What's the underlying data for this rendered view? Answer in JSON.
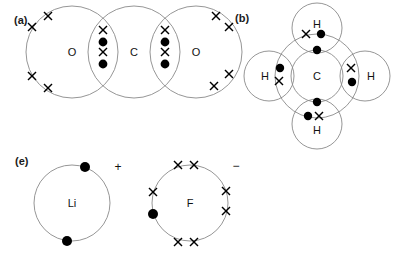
{
  "figure": {
    "background_color": "#ffffff",
    "shell_color": "#8a8a8a",
    "electron_color": "#000000",
    "width": 397,
    "height": 259
  },
  "panels": [
    {
      "key": "a",
      "label": "(a)",
      "molecule": "CO2",
      "description": "carbon dioxide, two carbon-oxygen double bonds",
      "atoms": [
        {
          "symbol": "O",
          "position": "left"
        },
        {
          "symbol": "C",
          "position": "centre"
        },
        {
          "symbol": "O",
          "position": "right"
        }
      ],
      "bonds": [
        {
          "between": "O-C",
          "type": "double",
          "shared_electrons": 4,
          "marks": "X dot X dot"
        },
        {
          "between": "C-O",
          "type": "double",
          "shared_electrons": 4,
          "marks": "X dot X dot"
        }
      ],
      "lone_pairs": {
        "left_oxygen_crosses": 4,
        "right_oxygen_crosses": 4
      }
    },
    {
      "key": "b",
      "label": "(b)",
      "molecule": "CH4",
      "description": "methane, four carbon-hydrogen single bonds",
      "atoms": [
        {
          "symbol": "C",
          "position": "centre"
        },
        {
          "symbol": "H",
          "position": "top"
        },
        {
          "symbol": "H",
          "position": "left"
        },
        {
          "symbol": "H",
          "position": "right"
        },
        {
          "symbol": "H",
          "position": "bottom"
        }
      ],
      "bonds": [
        {
          "between": "C-H",
          "type": "single",
          "shared_electrons": 2,
          "marks": "X dot"
        },
        {
          "between": "C-H",
          "type": "single",
          "shared_electrons": 2,
          "marks": "dot X"
        },
        {
          "between": "C-H",
          "type": "single",
          "shared_electrons": 2,
          "marks": "X dot"
        },
        {
          "between": "C-H",
          "type": "single",
          "shared_electrons": 2,
          "marks": "dot X"
        }
      ],
      "inner_shell_electrons": 4
    },
    {
      "key": "e",
      "label": "(e)",
      "molecule": "LiF",
      "description": "lithium fluoride, ionic, electron transferred from Li to F",
      "ions": [
        {
          "symbol": "Li",
          "charge": "+",
          "shell_electrons": 2,
          "electron_marks": "dot",
          "note": "inner shell only, outer electron lost"
        },
        {
          "symbol": "F",
          "charge": "−",
          "shell_electrons": 8,
          "crosses": 7,
          "dots": 1,
          "note": "gained one electron shown as a dot"
        }
      ]
    }
  ]
}
